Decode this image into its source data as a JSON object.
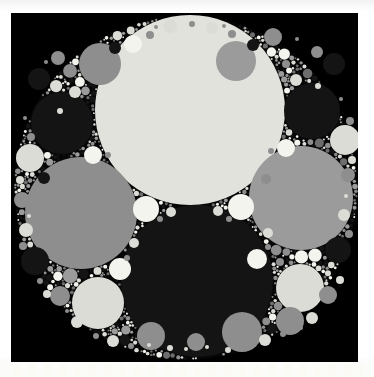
{
  "figure": {
    "kind": "apollonian-gasket",
    "title": "",
    "background_color": "#000000",
    "page_color": "#ffffff",
    "canvas": {
      "width": 374,
      "height": 377
    },
    "plot_area": {
      "x": 11,
      "y": 13,
      "width": 347,
      "height": 349
    },
    "outer_disk": {
      "cx": 186,
      "cy": 188,
      "r": 172
    },
    "palette": {
      "cream": "#e2e2dd",
      "light": "#dcdcd6",
      "pale": "#efefe9",
      "gray": "#8e8e8e",
      "mid_gray": "#9b9b9b",
      "dark_gray": "#6d6d6d",
      "near_black": "#141414",
      "black": "#000000",
      "white": "#f4f4ef"
    }
  },
  "chart_data": {
    "type": "scatter",
    "xlabel": "",
    "ylabel": "",
    "xlim": [
      11,
      358
    ],
    "ylim": [
      13,
      362
    ],
    "grid": false,
    "legend": null,
    "columns": [
      "cx",
      "cy",
      "r",
      "fill"
    ],
    "circles": [
      [
        190,
        110,
        95,
        "#e2e2dd"
      ],
      [
        197,
        281,
        76,
        "#141414"
      ],
      [
        81,
        213,
        56,
        "#8e8e8e"
      ],
      [
        301,
        198,
        52,
        "#9b9b9b"
      ],
      [
        62,
        123,
        31,
        "#141414"
      ],
      [
        312,
        111,
        28,
        "#141414"
      ],
      [
        98,
        303,
        26,
        "#dcdcd6"
      ],
      [
        300,
        288,
        24,
        "#dcdcd6"
      ],
      [
        242,
        332,
        20,
        "#8e8e8e"
      ],
      [
        236,
        61,
        20,
        "#9b9b9b"
      ],
      [
        100,
        64,
        21,
        "#8e8e8e"
      ],
      [
        290,
        321,
        14,
        "#8e8e8e"
      ],
      [
        345,
        140,
        15,
        "#dcdcd6"
      ],
      [
        30,
        158,
        14,
        "#dcdcd6"
      ],
      [
        151,
        336,
        14,
        "#8e8e8e"
      ],
      [
        146,
        209,
        13,
        "#f4f4ef"
      ],
      [
        241,
        207,
        13,
        "#f4f4ef"
      ],
      [
        120,
        269,
        11,
        "#f4f4ef"
      ],
      [
        257,
        259,
        10,
        "#f4f4ef"
      ],
      [
        93,
        155,
        9,
        "#f4f4ef"
      ],
      [
        286,
        148,
        9,
        "#f4f4ef"
      ],
      [
        133,
        44,
        9,
        "#f4f4ef"
      ],
      [
        273,
        37,
        9,
        "#8e8e8e"
      ],
      [
        334,
        64,
        11,
        "#141414"
      ],
      [
        39,
        79,
        11,
        "#141414"
      ],
      [
        35,
        261,
        14,
        "#141414"
      ],
      [
        338,
        250,
        13,
        "#141414"
      ],
      [
        60,
        296,
        10,
        "#8e8e8e"
      ],
      [
        196,
        342,
        9,
        "#8e8e8e"
      ],
      [
        328,
        295,
        9,
        "#8e8e8e"
      ],
      [
        58,
        58,
        7,
        "#8e8e8e"
      ],
      [
        317,
        52,
        6,
        "#8e8e8e"
      ],
      [
        348,
        175,
        7,
        "#8e8e8e"
      ],
      [
        22,
        200,
        8,
        "#8e8e8e"
      ],
      [
        26,
        230,
        7,
        "#dcdcd6"
      ],
      [
        344,
        215,
        6,
        "#dcdcd6"
      ],
      [
        170,
        26,
        7,
        "#dcdcd6"
      ],
      [
        212,
        28,
        6,
        "#dcdcd6"
      ],
      [
        75,
        92,
        6,
        "#dcdcd6"
      ],
      [
        296,
        80,
        6,
        "#dcdcd6"
      ],
      [
        115,
        48,
        6,
        "#141414"
      ],
      [
        253,
        45,
        6,
        "#141414"
      ],
      [
        44,
        178,
        6,
        "#141414"
      ],
      [
        113,
        341,
        6,
        "#dcdcd6"
      ],
      [
        265,
        340,
        6,
        "#dcdcd6"
      ],
      [
        77,
        322,
        6,
        "#dcdcd6"
      ],
      [
        312,
        318,
        6,
        "#dcdcd6"
      ],
      [
        171,
        212,
        5,
        "#dcdcd6"
      ],
      [
        218,
        211,
        5,
        "#dcdcd6"
      ],
      [
        134,
        243,
        5,
        "#dcdcd6"
      ],
      [
        268,
        233,
        5,
        "#dcdcd6"
      ],
      [
        109,
        241,
        5,
        "#8e8e8e"
      ],
      [
        280,
        262,
        4,
        "#8e8e8e"
      ],
      [
        119,
        196,
        5,
        "#8e8e8e"
      ],
      [
        266,
        179,
        5,
        "#8e8e8e"
      ],
      [
        47,
        294,
        4,
        "#dcdcd6"
      ],
      [
        340,
        280,
        4,
        "#dcdcd6"
      ],
      [
        150,
        35,
        4,
        "#8e8e8e"
      ],
      [
        232,
        34,
        4,
        "#8e8e8e"
      ],
      [
        88,
        76,
        4,
        "#8e8e8e"
      ],
      [
        286,
        64,
        4,
        "#8e8e8e"
      ],
      [
        31,
        137,
        4,
        "#8e8e8e"
      ],
      [
        350,
        121,
        4,
        "#8e8e8e"
      ],
      [
        20,
        180,
        4,
        "#dcdcd6"
      ],
      [
        352,
        160,
        4,
        "#dcdcd6"
      ],
      [
        23,
        246,
        4,
        "#8e8e8e"
      ],
      [
        349,
        234,
        4,
        "#8e8e8e"
      ],
      [
        40,
        281,
        3,
        "#8e8e8e"
      ],
      [
        96,
        336,
        3,
        "#8e8e8e"
      ],
      [
        228,
        350,
        3,
        "#dcdcd6"
      ],
      [
        170,
        348,
        3,
        "#dcdcd6"
      ],
      [
        131,
        346,
        3,
        "#8e8e8e"
      ],
      [
        283,
        334,
        3,
        "#8e8e8e"
      ],
      [
        60,
        111,
        3,
        "#dcdcd6"
      ],
      [
        318,
        86,
        3,
        "#dcdcd6"
      ],
      [
        192,
        24,
        3,
        "#8e8e8e"
      ],
      [
        108,
        155,
        3,
        "#8e8e8e"
      ],
      [
        271,
        151,
        3,
        "#8e8e8e"
      ],
      [
        160,
        219,
        3,
        "#8e8e8e"
      ],
      [
        229,
        219,
        3,
        "#8e8e8e"
      ],
      [
        127,
        258,
        3,
        "#8e8e8e"
      ],
      [
        268,
        247,
        3,
        "#8e8e8e"
      ],
      [
        207,
        347,
        2,
        "#dcdcd6"
      ],
      [
        186,
        349,
        2,
        "#dcdcd6"
      ],
      [
        149,
        345,
        2,
        "#dcdcd6"
      ],
      [
        246,
        346,
        2,
        "#8e8e8e"
      ],
      [
        301,
        328,
        2,
        "#8e8e8e"
      ],
      [
        67,
        311,
        2,
        "#8e8e8e"
      ],
      [
        29,
        216,
        2,
        "#dcdcd6"
      ],
      [
        346,
        196,
        2,
        "#dcdcd6"
      ],
      [
        25,
        118,
        2,
        "#8e8e8e"
      ],
      [
        341,
        99,
        2,
        "#8e8e8e"
      ],
      [
        46,
        62,
        2,
        "#8e8e8e"
      ],
      [
        297,
        39,
        2,
        "#8e8e8e"
      ],
      [
        156,
        27,
        2,
        "#8e8e8e"
      ],
      [
        224,
        26,
        2,
        "#8e8e8e"
      ]
    ],
    "counts": {
      "circles_drawn": 97,
      "large_circles": 4,
      "background_disk": 1
    }
  }
}
